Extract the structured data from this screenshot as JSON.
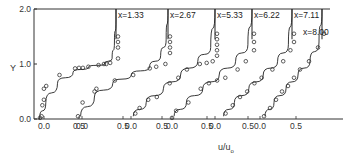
{
  "chart_data": {
    "type": "line",
    "title": "",
    "xlabel": "u/u0",
    "xlabel_main": "u/u",
    "xlabel_sub": "o",
    "ylabel": "Y",
    "ylim": [
      0.0,
      2.0
    ],
    "y_ticks": [
      "0.0",
      "1.0",
      "2.0"
    ],
    "grid": false,
    "legend": "none",
    "x_tick_labels": [
      "0.0",
      "0.5",
      "0.0",
      "0.5",
      "0.0",
      "0.5",
      "0.0",
      "0.5",
      "0.0",
      "0.5",
      "0.0",
      "0.5"
    ],
    "series": [
      {
        "name": "x=1.33",
        "label": "x=1.33",
        "line": {
          "u": [
            0.02,
            0.1,
            0.25,
            0.45,
            0.65,
            0.85,
            0.95,
            0.98,
            1.0,
            1.0
          ],
          "Y": [
            0.0,
            0.3,
            0.65,
            0.85,
            0.95,
            1.0,
            1.1,
            1.4,
            1.8,
            2.0
          ]
        },
        "points": {
          "u": [
            0.0,
            0.02,
            0.03,
            0.05,
            0.05,
            0.08,
            0.25,
            0.45,
            0.5,
            0.55,
            0.62,
            0.75,
            0.82,
            0.85,
            0.9,
            1.0,
            1.0,
            1.0,
            1.0
          ],
          "Y": [
            0.02,
            0.05,
            0.25,
            0.35,
            0.55,
            0.6,
            0.8,
            0.92,
            0.93,
            0.93,
            0.95,
            0.98,
            1.0,
            1.0,
            1.02,
            1.1,
            1.3,
            1.4,
            1.5
          ]
        }
      },
      {
        "name": "x=2.67",
        "label": "x=2.67",
        "line": {
          "u": [
            0.05,
            0.2,
            0.4,
            0.6,
            0.8,
            0.92,
            0.98,
            1.0
          ],
          "Y": [
            0.05,
            0.4,
            0.65,
            0.8,
            0.95,
            1.15,
            1.45,
            2.0
          ]
        },
        "points": {
          "u": [
            0.0,
            0.05,
            0.18,
            0.2,
            0.4,
            0.6,
            0.78,
            0.85,
            0.95,
            1.0,
            1.0,
            1.0,
            1.0
          ],
          "Y": [
            0.05,
            0.3,
            0.5,
            0.55,
            0.7,
            0.8,
            0.92,
            0.95,
            1.0,
            1.2,
            1.3,
            1.4,
            1.5
          ]
        }
      },
      {
        "name": "x=5.33",
        "label": "x=5.33",
        "line": {
          "u": [
            0.05,
            0.2,
            0.4,
            0.6,
            0.8,
            0.95,
            1.0
          ],
          "Y": [
            0.05,
            0.3,
            0.55,
            0.8,
            1.05,
            1.3,
            2.0
          ]
        },
        "points": {
          "u": [
            0.05,
            0.1,
            0.2,
            0.3,
            0.45,
            0.55,
            0.65,
            0.8,
            0.88,
            0.95,
            1.0,
            1.0,
            1.0,
            1.0,
            1.0
          ],
          "Y": [
            0.1,
            0.2,
            0.35,
            0.4,
            0.65,
            0.75,
            0.9,
            1.0,
            1.02,
            1.05,
            1.15,
            1.25,
            1.35,
            1.45,
            1.55
          ]
        }
      },
      {
        "name": "x=6.22",
        "label": "x=6.22",
        "line": {
          "u": [
            0.05,
            0.2,
            0.4,
            0.6,
            0.8,
            0.95,
            1.0
          ],
          "Y": [
            0.05,
            0.3,
            0.55,
            0.8,
            1.05,
            1.35,
            2.0
          ]
        },
        "points": {
          "u": [
            0.0,
            0.05,
            0.2,
            0.35,
            0.45,
            0.55,
            0.65,
            0.8,
            0.9,
            1.0,
            1.0,
            1.0
          ],
          "Y": [
            0.02,
            0.15,
            0.3,
            0.55,
            0.65,
            0.7,
            0.75,
            0.9,
            1.05,
            1.25,
            1.4,
            1.55
          ]
        }
      },
      {
        "name": "x=7.11",
        "label": "x=7.11",
        "line": {
          "u": [
            0.05,
            0.2,
            0.4,
            0.6,
            0.8,
            0.95,
            1.0
          ],
          "Y": [
            0.05,
            0.3,
            0.55,
            0.8,
            1.05,
            1.35,
            2.0
          ]
        },
        "points": {
          "u": [
            0.05,
            0.15,
            0.25,
            0.35,
            0.45,
            0.55,
            0.7,
            0.85,
            0.95,
            1.0,
            1.0
          ],
          "Y": [
            0.1,
            0.25,
            0.4,
            0.5,
            0.65,
            0.75,
            0.9,
            1.05,
            1.25,
            1.4,
            1.55
          ]
        }
      },
      {
        "name": "x=8.00",
        "label": "x=8.00",
        "line": {
          "u": [
            0.05,
            0.2,
            0.4,
            0.6,
            0.8,
            0.95,
            1.0
          ],
          "Y": [
            0.05,
            0.3,
            0.55,
            0.8,
            1.05,
            1.4,
            2.0
          ]
        },
        "points": {
          "u": [
            0.0,
            0.1,
            0.2,
            0.3,
            0.4,
            0.5,
            0.6,
            0.75,
            0.9,
            1.0
          ],
          "Y": [
            0.05,
            0.2,
            0.35,
            0.5,
            0.6,
            0.75,
            0.9,
            1.05,
            1.3,
            1.55
          ]
        }
      }
    ]
  },
  "colors": {
    "axis": "#333333",
    "line": "#222222",
    "marker": "#333333",
    "background": "#ffffff"
  }
}
